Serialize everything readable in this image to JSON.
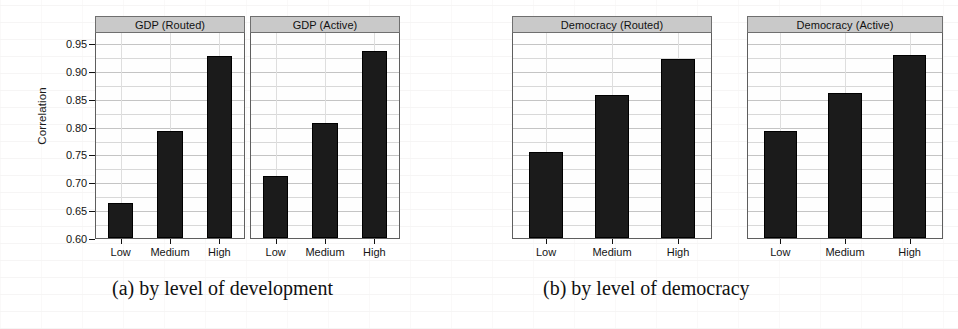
{
  "figure": {
    "y_axis_label": "Correlation",
    "y_ticks": [
      "0.95",
      "0.90",
      "0.85",
      "0.80",
      "0.75",
      "0.70",
      "0.65",
      "0.60"
    ],
    "x_categories": [
      "Low",
      "Medium",
      "High"
    ],
    "caption_a": "(a) by level of development",
    "caption_b": "(b) by level of democracy",
    "panel_titles": [
      "GDP (Routed)",
      "GDP (Active)",
      "Democracy (Routed)",
      "Democracy (Active)"
    ]
  },
  "chart_data": {
    "type": "bar",
    "title": "",
    "xlabel": "",
    "ylabel": "Correlation",
    "ylim": [
      0.6,
      0.97
    ],
    "yticks": [
      0.6,
      0.65,
      0.7,
      0.75,
      0.8,
      0.85,
      0.9,
      0.95
    ],
    "grid": true,
    "legend": "none",
    "categories": [
      "Low",
      "Medium",
      "High"
    ],
    "panels": [
      {
        "title": "GDP (Routed)",
        "group": "(a) by level of development",
        "categories": [
          "Low",
          "Medium",
          "High"
        ],
        "values": [
          0.662,
          0.793,
          0.927
        ]
      },
      {
        "title": "GDP (Active)",
        "group": "(a) by level of development",
        "categories": [
          "Low",
          "Medium",
          "High"
        ],
        "values": [
          0.711,
          0.807,
          0.936
        ]
      },
      {
        "title": "Democracy (Routed)",
        "group": "(b) by level of democracy",
        "categories": [
          "Low",
          "Medium",
          "High"
        ],
        "values": [
          0.754,
          0.856,
          0.922
        ]
      },
      {
        "title": "Democracy (Active)",
        "group": "(b) by level of democracy",
        "categories": [
          "Low",
          "Medium",
          "High"
        ],
        "values": [
          0.792,
          0.86,
          0.929
        ]
      }
    ]
  },
  "style": {
    "bar_color": "#1b1b1b",
    "strip_color": "#c9c9c9",
    "grid_color": "#d8d8d8",
    "axis_color": "#5e5e5e"
  }
}
